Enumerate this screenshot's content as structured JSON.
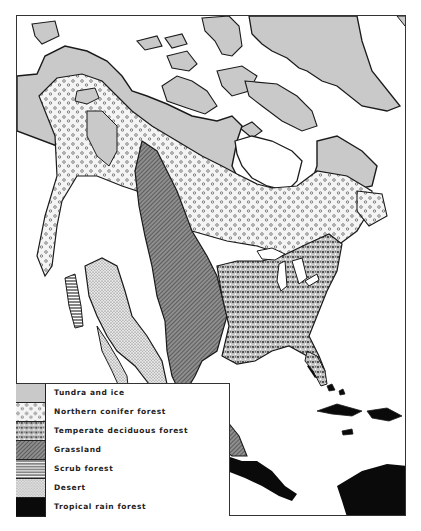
{
  "map": {
    "subject": "Vegetation zones of North America",
    "colors": {
      "tundra": "#c9c9c9",
      "outline": "#1a1a1a",
      "rainforest": "#0a0a0a",
      "background": "#ffffff"
    }
  },
  "legend": {
    "items": [
      {
        "id": "tundra",
        "label": "Tundra and ice",
        "pattern": "light-gray-solid"
      },
      {
        "id": "conifer",
        "label": "Northern conifer forest",
        "pattern": "sparse-circles"
      },
      {
        "id": "deciduous",
        "label": "Temperate deciduous forest",
        "pattern": "dense-stipple"
      },
      {
        "id": "grassland",
        "label": "Grassland",
        "pattern": "diagonal-hatch"
      },
      {
        "id": "scrub",
        "label": "Scrub forest",
        "pattern": "horizontal-lines"
      },
      {
        "id": "desert",
        "label": "Desert",
        "pattern": "fine-dots"
      },
      {
        "id": "rainforest",
        "label": "Tropical rain forest",
        "pattern": "solid-black"
      }
    ]
  }
}
